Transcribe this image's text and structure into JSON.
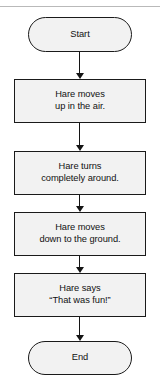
{
  "diagram": {
    "orientation": "top-to-bottom",
    "colors": {
      "node_fill": "#f2f2f2",
      "node_border": "#1a1a1a",
      "connector": "#141414",
      "text": "#111111",
      "top_rule": "#b9b9b9",
      "background": "#ffffff"
    },
    "top_rule_present": true,
    "nodes": [
      {
        "id": "start",
        "shape": "terminator",
        "label": "Start",
        "x": 28,
        "y": 17,
        "width": 104,
        "height": 35
      },
      {
        "id": "step-1",
        "shape": "process",
        "label": "Hare moves\nup in the air.",
        "x": 14,
        "y": 79,
        "width": 132,
        "height": 44
      },
      {
        "id": "step-2",
        "shape": "process",
        "label": "Hare turns\ncompletely around.",
        "x": 14,
        "y": 151,
        "width": 132,
        "height": 44
      },
      {
        "id": "step-3",
        "shape": "process",
        "label": "Hare moves\ndown to the ground.",
        "x": 14,
        "y": 212,
        "width": 132,
        "height": 44
      },
      {
        "id": "step-4",
        "shape": "process",
        "label": "Hare says\n“That was fun!”",
        "x": 14,
        "y": 273,
        "width": 132,
        "height": 44
      },
      {
        "id": "end",
        "shape": "terminator",
        "label": "End",
        "x": 28,
        "y": 341,
        "width": 104,
        "height": 34
      }
    ],
    "connectors": [
      {
        "id": "start-to-step-1",
        "from": "start",
        "to": "step-1",
        "top": 52,
        "length": 21
      },
      {
        "id": "step-1-to-step-2",
        "from": "step-1",
        "to": "step-2",
        "top": 123,
        "length": 22
      },
      {
        "id": "step-2-to-step-3",
        "from": "step-2",
        "to": "step-3",
        "top": 195,
        "length": 11
      },
      {
        "id": "step-3-to-step-4",
        "from": "step-3",
        "to": "step-4",
        "top": 256,
        "length": 11
      },
      {
        "id": "step-4-to-end",
        "from": "step-4",
        "to": "end",
        "top": 317,
        "length": 18
      }
    ]
  }
}
